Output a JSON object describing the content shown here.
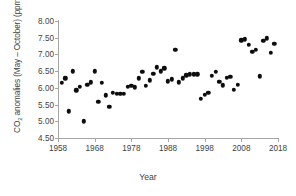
{
  "chart_data": {
    "type": "scatter",
    "title": "",
    "xlabel": "Year",
    "ylabel": "CO2 anomalies (May – October) (ppm)",
    "ylabel_parts": {
      "prefix": "CO",
      "sub": "2",
      "suffix": " anomalies (May – October) (ppm)"
    },
    "xlim": [
      1958,
      2018
    ],
    "ylim": [
      4.5,
      8.0
    ],
    "xticks": [
      1958,
      1968,
      1978,
      1988,
      1998,
      2008,
      2018
    ],
    "yticks": [
      "4.50",
      "5.00",
      "5.50",
      "6.00",
      "6.50",
      "7.00",
      "7.50",
      "8.00"
    ],
    "ytick_values": [
      4.5,
      5.0,
      5.5,
      6.0,
      6.5,
      7.0,
      7.5,
      8.0
    ],
    "grid": false,
    "legend": null,
    "marker": {
      "shape": "circle",
      "color": "#0d0d0d",
      "size": 4.4
    },
    "x": [
      1959,
      1960,
      1961,
      1962,
      1963,
      1964,
      1965,
      1966,
      1967,
      1968,
      1969,
      1970,
      1971,
      1972,
      1973,
      1974,
      1975,
      1976,
      1977,
      1978,
      1979,
      1980,
      1981,
      1982,
      1983,
      1984,
      1985,
      1986,
      1987,
      1988,
      1989,
      1990,
      1991,
      1992,
      1993,
      1994,
      1995,
      1996,
      1997,
      1998,
      1999,
      2000,
      2001,
      2002,
      2003,
      2004,
      2005,
      2006,
      2007,
      2008,
      2009,
      2010,
      2011,
      2012,
      2013,
      2014,
      2015,
      2016,
      2017
    ],
    "y": [
      6.15,
      6.28,
      5.3,
      6.5,
      5.93,
      6.03,
      5.0,
      6.09,
      6.17,
      6.5,
      5.58,
      6.16,
      5.78,
      5.43,
      5.85,
      5.82,
      5.82,
      5.82,
      6.03,
      6.07,
      6.02,
      6.28,
      6.48,
      6.06,
      6.23,
      6.42,
      6.62,
      6.5,
      6.58,
      6.2,
      6.26,
      7.13,
      6.17,
      6.28,
      6.38,
      6.4,
      6.4,
      6.4,
      5.67,
      5.8,
      5.86,
      6.36,
      6.48,
      6.18,
      6.08,
      6.3,
      6.33,
      5.95,
      6.1,
      7.42,
      7.45,
      7.28,
      7.08,
      7.13,
      6.35,
      7.4,
      7.48,
      7.05,
      7.32
    ],
    "points": [
      {
        "year": 1959,
        "value": 6.15
      },
      {
        "year": 1960,
        "value": 6.28
      },
      {
        "year": 1961,
        "value": 5.3
      },
      {
        "year": 1962,
        "value": 6.5
      },
      {
        "year": 1963,
        "value": 5.93
      },
      {
        "year": 1964,
        "value": 6.03
      },
      {
        "year": 1965,
        "value": 5.0
      },
      {
        "year": 1966,
        "value": 6.09
      },
      {
        "year": 1967,
        "value": 6.17
      },
      {
        "year": 1968,
        "value": 6.5
      },
      {
        "year": 1969,
        "value": 5.58
      },
      {
        "year": 1970,
        "value": 6.16
      },
      {
        "year": 1971,
        "value": 5.78
      },
      {
        "year": 1972,
        "value": 5.43
      },
      {
        "year": 1973,
        "value": 5.85
      },
      {
        "year": 1974,
        "value": 5.82
      },
      {
        "year": 1975,
        "value": 5.82
      },
      {
        "year": 1976,
        "value": 5.82
      },
      {
        "year": 1977,
        "value": 6.03
      },
      {
        "year": 1978,
        "value": 6.07
      },
      {
        "year": 1979,
        "value": 6.02
      },
      {
        "year": 1980,
        "value": 6.28
      },
      {
        "year": 1981,
        "value": 6.48
      },
      {
        "year": 1982,
        "value": 6.06
      },
      {
        "year": 1983,
        "value": 6.23
      },
      {
        "year": 1984,
        "value": 6.42
      },
      {
        "year": 1985,
        "value": 6.62
      },
      {
        "year": 1986,
        "value": 6.5
      },
      {
        "year": 1987,
        "value": 6.58
      },
      {
        "year": 1988,
        "value": 6.2
      },
      {
        "year": 1989,
        "value": 6.26
      },
      {
        "year": 1990,
        "value": 7.13
      },
      {
        "year": 1991,
        "value": 6.17
      },
      {
        "year": 1992,
        "value": 6.28
      },
      {
        "year": 1993,
        "value": 6.38
      },
      {
        "year": 1994,
        "value": 6.4
      },
      {
        "year": 1995,
        "value": 6.4
      },
      {
        "year": 1996,
        "value": 6.4
      },
      {
        "year": 1997,
        "value": 5.67
      },
      {
        "year": 1998,
        "value": 5.8
      },
      {
        "year": 1999,
        "value": 5.86
      },
      {
        "year": 2000,
        "value": 6.36
      },
      {
        "year": 2001,
        "value": 6.48
      },
      {
        "year": 2002,
        "value": 6.18
      },
      {
        "year": 2003,
        "value": 6.08
      },
      {
        "year": 2004,
        "value": 6.3
      },
      {
        "year": 2005,
        "value": 6.33
      },
      {
        "year": 2006,
        "value": 5.95
      },
      {
        "year": 2007,
        "value": 6.1
      },
      {
        "year": 2008,
        "value": 7.42
      },
      {
        "year": 2009,
        "value": 7.45
      },
      {
        "year": 2010,
        "value": 7.28
      },
      {
        "year": 2011,
        "value": 7.08
      },
      {
        "year": 2012,
        "value": 7.13
      },
      {
        "year": 2013,
        "value": 6.35
      },
      {
        "year": 2014,
        "value": 7.4
      },
      {
        "year": 2015,
        "value": 7.48
      },
      {
        "year": 2016,
        "value": 7.05
      },
      {
        "year": 2017,
        "value": 7.32
      }
    ]
  }
}
